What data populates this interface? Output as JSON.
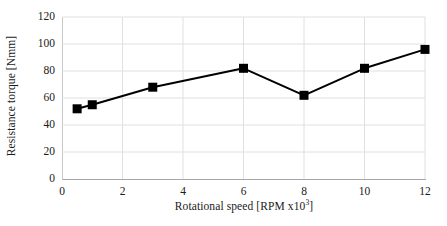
{
  "chart_data": {
    "type": "line",
    "title": "",
    "xlabel": "Rotational speed [RPM x10³]",
    "xlabel_base": "Rotational speed [RPM x10",
    "xlabel_sup": "3",
    "xlabel_tail": "]",
    "ylabel": "Resistance torque [Nmm]",
    "x": [
      0.5,
      1,
      3,
      6,
      8,
      10,
      12
    ],
    "values": [
      52,
      55,
      68,
      82,
      62,
      82,
      96
    ],
    "xlim": [
      0,
      12
    ],
    "ylim": [
      0,
      120
    ],
    "xticks": [
      "0",
      "2",
      "4",
      "6",
      "8",
      "10",
      "12"
    ],
    "xtick_values": [
      0,
      2,
      4,
      6,
      8,
      10,
      12
    ],
    "yticks": [
      "0",
      "20",
      "40",
      "60",
      "80",
      "100",
      "120"
    ],
    "ytick_values": [
      0,
      20,
      40,
      60,
      80,
      100,
      120
    ],
    "grid": {
      "horizontal": true,
      "vertical": true,
      "color": "#e0e0e0"
    },
    "legend": null,
    "series_color": "#000000",
    "marker": "square",
    "marker_size": 9,
    "line_width": 2
  },
  "style": {
    "background": "#ffffff",
    "axis_color": "#a6a6a6",
    "grid_color": "#e2e2e2",
    "text_color": "#1a1a1a"
  }
}
